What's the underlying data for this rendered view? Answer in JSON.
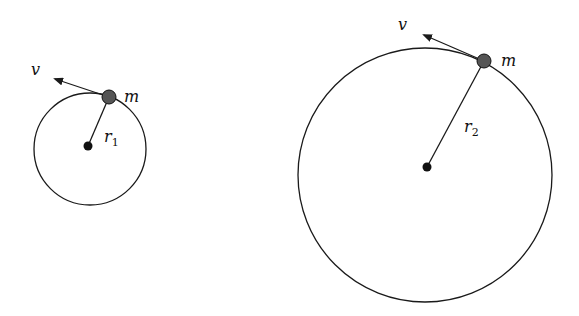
{
  "diagram": {
    "colors": {
      "stroke": "#1a1a1a",
      "mass_fill": "#555555",
      "background": "#ffffff"
    },
    "orbits": [
      {
        "id": "orbit-1",
        "circle": {
          "cx": 90,
          "cy": 149,
          "r": 56
        },
        "center": {
          "x": 88,
          "y": 146
        },
        "mass": {
          "x": 109,
          "y": 97,
          "r": 7,
          "label": "m",
          "label_x": 124,
          "label_y": 102
        },
        "velocity": {
          "tip_x": 55,
          "tip_y": 79,
          "label": "v",
          "label_x": 31,
          "label_y": 75
        },
        "radius_label": {
          "main": "r",
          "sub": "1",
          "x": 104,
          "y": 142
        }
      },
      {
        "id": "orbit-2",
        "circle": {
          "cx": 425,
          "cy": 175,
          "r": 127
        },
        "center": {
          "x": 427,
          "y": 167
        },
        "mass": {
          "x": 484,
          "y": 61,
          "r": 7,
          "label": "m",
          "label_x": 501,
          "label_y": 66
        },
        "velocity": {
          "tip_x": 424,
          "tip_y": 35,
          "label": "v",
          "label_x": 398,
          "label_y": 30
        },
        "radius_label": {
          "main": "r",
          "sub": "2",
          "x": 464,
          "y": 132
        }
      }
    ]
  }
}
